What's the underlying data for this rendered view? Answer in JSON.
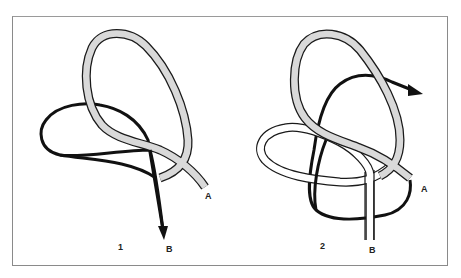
{
  "figure": {
    "panels": [
      {
        "step_label": "1",
        "end_labels": {
          "working_end": "B",
          "standing_end": "A"
        }
      },
      {
        "step_label": "2",
        "end_labels": {
          "working_end": "B",
          "standing_end": "A"
        }
      }
    ],
    "colors": {
      "grey_rope_fill": "#d9d9d9",
      "rope_outline": "#1a1a1a",
      "black_rope": "#111111",
      "white_rope_fill": "#ffffff",
      "frame_border": "#8a8a8a"
    }
  }
}
